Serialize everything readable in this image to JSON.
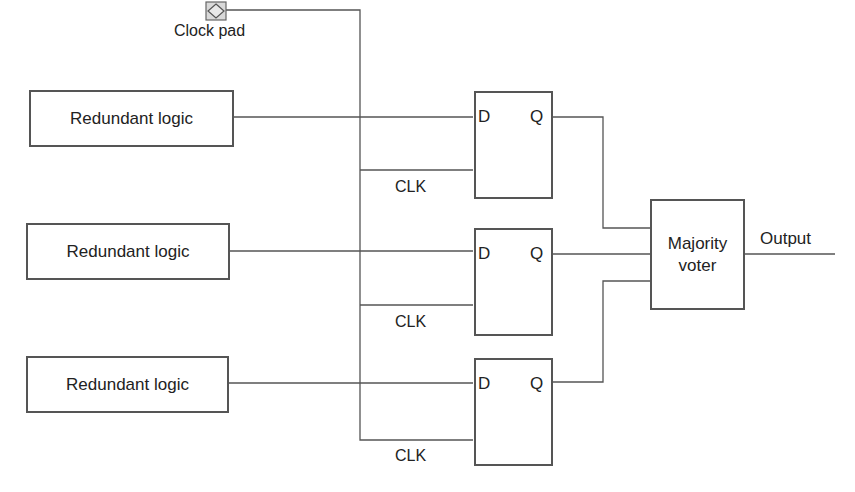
{
  "diagram": {
    "type": "triple modular redundancy circuit",
    "clock_pad": {
      "label": "Clock pad",
      "icon": "clock-pad-icon"
    },
    "redundant_blocks": [
      {
        "label": "Redundant logic"
      },
      {
        "label": "Redundant logic"
      },
      {
        "label": "Redundant logic"
      }
    ],
    "flip_flops": [
      {
        "d_label": "D",
        "q_label": "Q",
        "clk_label": "CLK"
      },
      {
        "d_label": "D",
        "q_label": "Q",
        "clk_label": "CLK"
      },
      {
        "d_label": "D",
        "q_label": "Q",
        "clk_label": "CLK"
      }
    ],
    "voter": {
      "line1": "Majority",
      "line2": "voter"
    },
    "output": {
      "label": "Output"
    },
    "colors": {
      "line": "#555555",
      "pad_fill": "#d9d9d9",
      "text": "#222222"
    }
  }
}
